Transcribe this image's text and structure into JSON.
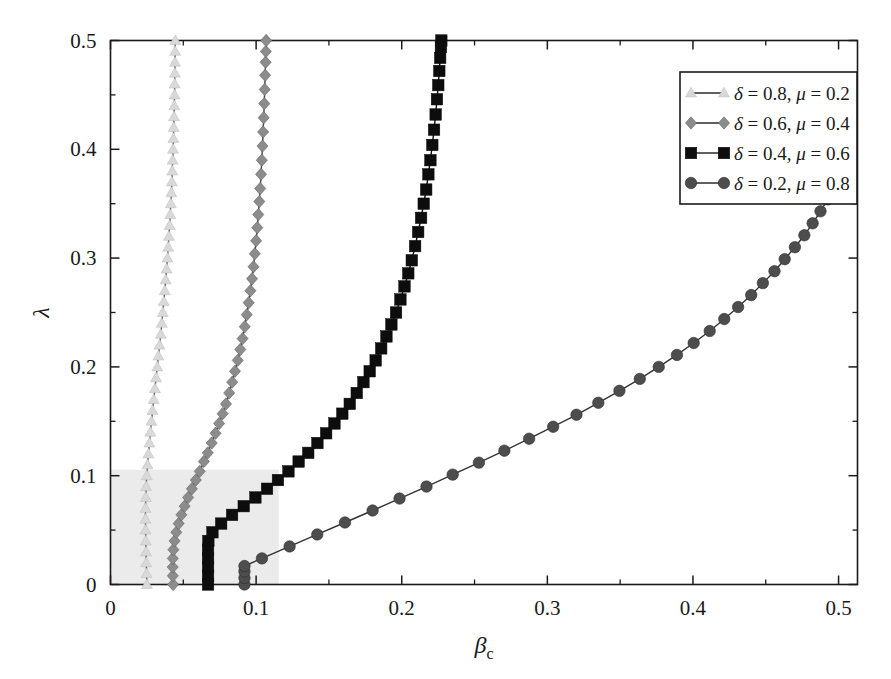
{
  "figure": {
    "title": "",
    "background_color": "#ffffff",
    "frame_color": "#1a1a1a"
  },
  "axes": {
    "x": {
      "label": "β",
      "label_sub": "c",
      "min": 0,
      "max": 0.513,
      "ticks": [
        0,
        0.1,
        0.2,
        0.3,
        0.4,
        0.5
      ],
      "tick_labels": [
        "0",
        "0.1",
        "0.2",
        "0.3",
        "0.4",
        "0.5"
      ],
      "minor_ticks": [
        0.05,
        0.15,
        0.25,
        0.35,
        0.45
      ]
    },
    "y": {
      "label": "λ",
      "min": 0,
      "max": 0.5,
      "ticks": [
        0,
        0.1,
        0.2,
        0.3,
        0.4,
        0.5
      ],
      "tick_labels": [
        "0",
        "0.1",
        "0.2",
        "0.3",
        "0.4",
        "0.5"
      ],
      "minor_ticks": [
        0.05,
        0.15,
        0.25,
        0.35,
        0.45
      ]
    }
  },
  "shaded_region": {
    "color": "#ebebeb",
    "x0": 0,
    "x1": 0.1155,
    "y0": 0,
    "y1": 0.1055
  },
  "legend": {
    "position": "top-right",
    "border_color": "#1a1a1a",
    "background": "#ffffff",
    "entries": [
      {
        "label": "δ = 0.8, μ = 0.2",
        "delta": "0.8",
        "mu": "0.2",
        "marker": "triangle",
        "color": "#d9d9d9"
      },
      {
        "label": "δ = 0.6, μ = 0.4",
        "delta": "0.6",
        "mu": "0.4",
        "marker": "diamond",
        "color": "#8c8c8c"
      },
      {
        "label": "δ = 0.4, μ = 0.6",
        "delta": "0.4",
        "mu": "0.6",
        "marker": "square",
        "color": "#0d0d0d"
      },
      {
        "label": "δ = 0.2, μ = 0.8",
        "delta": "0.2",
        "mu": "0.8",
        "marker": "circle",
        "color": "#4d4d4d"
      }
    ]
  },
  "chart_data": {
    "type": "line",
    "title": "",
    "xlabel": "β_c",
    "ylabel": "λ",
    "xlim": [
      0,
      0.513
    ],
    "ylim": [
      0,
      0.5
    ],
    "grid": false,
    "legend_position": "top-right",
    "series": [
      {
        "name": "δ = 0.8, μ = 0.2",
        "marker": "triangle",
        "color": "#d9d9d9",
        "line_color": "#555555",
        "points": [
          [
            0.025,
            0.0
          ],
          [
            0.0248,
            0.01
          ],
          [
            0.0246,
            0.02
          ],
          [
            0.0244,
            0.03
          ],
          [
            0.0242,
            0.04
          ],
          [
            0.0241,
            0.05
          ],
          [
            0.024,
            0.06
          ],
          [
            0.024,
            0.07
          ],
          [
            0.0242,
            0.08
          ],
          [
            0.0245,
            0.09
          ],
          [
            0.0249,
            0.1
          ],
          [
            0.0254,
            0.11
          ],
          [
            0.026,
            0.12
          ],
          [
            0.0267,
            0.13
          ],
          [
            0.0274,
            0.14
          ],
          [
            0.0281,
            0.15
          ],
          [
            0.0289,
            0.16
          ],
          [
            0.0297,
            0.17
          ],
          [
            0.0305,
            0.18
          ],
          [
            0.0313,
            0.19
          ],
          [
            0.0321,
            0.2
          ],
          [
            0.0329,
            0.21
          ],
          [
            0.0337,
            0.22
          ],
          [
            0.0345,
            0.23
          ],
          [
            0.0352,
            0.24
          ],
          [
            0.0359,
            0.25
          ],
          [
            0.0366,
            0.26
          ],
          [
            0.0373,
            0.27
          ],
          [
            0.0379,
            0.28
          ],
          [
            0.0385,
            0.29
          ],
          [
            0.0391,
            0.3
          ],
          [
            0.0396,
            0.31
          ],
          [
            0.0401,
            0.32
          ],
          [
            0.0406,
            0.33
          ],
          [
            0.041,
            0.34
          ],
          [
            0.0414,
            0.35
          ],
          [
            0.0418,
            0.36
          ],
          [
            0.0421,
            0.37
          ],
          [
            0.0424,
            0.38
          ],
          [
            0.0427,
            0.39
          ],
          [
            0.043,
            0.4
          ],
          [
            0.0432,
            0.41
          ],
          [
            0.0434,
            0.42
          ],
          [
            0.0436,
            0.43
          ],
          [
            0.0438,
            0.44
          ],
          [
            0.044,
            0.45
          ],
          [
            0.0441,
            0.46
          ],
          [
            0.0442,
            0.47
          ],
          [
            0.0443,
            0.48
          ],
          [
            0.0444,
            0.49
          ],
          [
            0.0445,
            0.5
          ]
        ]
      },
      {
        "name": "δ = 0.6, μ = 0.4",
        "marker": "diamond",
        "color": "#8c8c8c",
        "line_color": "#444444",
        "points": [
          [
            0.043,
            0.0
          ],
          [
            0.0428,
            0.008
          ],
          [
            0.0427,
            0.016
          ],
          [
            0.0428,
            0.024
          ],
          [
            0.0432,
            0.032
          ],
          [
            0.044,
            0.04
          ],
          [
            0.0452,
            0.048
          ],
          [
            0.0468,
            0.056
          ],
          [
            0.0487,
            0.064
          ],
          [
            0.0509,
            0.072
          ],
          [
            0.0533,
            0.08
          ],
          [
            0.0559,
            0.088
          ],
          [
            0.0586,
            0.096
          ],
          [
            0.0613,
            0.104
          ],
          [
            0.0641,
            0.113
          ],
          [
            0.0668,
            0.121
          ],
          [
            0.0695,
            0.13
          ],
          [
            0.0721,
            0.139
          ],
          [
            0.0746,
            0.148
          ],
          [
            0.077,
            0.157
          ],
          [
            0.0793,
            0.166
          ],
          [
            0.0815,
            0.176
          ],
          [
            0.0836,
            0.186
          ],
          [
            0.0855,
            0.196
          ],
          [
            0.0874,
            0.206
          ],
          [
            0.0891,
            0.216
          ],
          [
            0.0907,
            0.226
          ],
          [
            0.0922,
            0.237
          ],
          [
            0.0936,
            0.248
          ],
          [
            0.0949,
            0.259
          ],
          [
            0.0961,
            0.27
          ],
          [
            0.0972,
            0.281
          ],
          [
            0.0982,
            0.292
          ],
          [
            0.0991,
            0.304
          ],
          [
            0.1,
            0.316
          ],
          [
            0.1008,
            0.328
          ],
          [
            0.1015,
            0.34
          ],
          [
            0.1022,
            0.352
          ],
          [
            0.1028,
            0.364
          ],
          [
            0.1034,
            0.377
          ],
          [
            0.1039,
            0.39
          ],
          [
            0.1044,
            0.403
          ],
          [
            0.1048,
            0.416
          ],
          [
            0.1052,
            0.429
          ],
          [
            0.1056,
            0.442
          ],
          [
            0.1059,
            0.455
          ],
          [
            0.1062,
            0.468
          ],
          [
            0.1065,
            0.48
          ],
          [
            0.1067,
            0.49
          ],
          [
            0.1069,
            0.5
          ]
        ]
      },
      {
        "name": "δ = 0.4, μ = 0.6",
        "marker": "square",
        "color": "#0d0d0d",
        "line_color": "#0d0d0d",
        "points": [
          [
            0.067,
            0.0
          ],
          [
            0.067,
            0.008
          ],
          [
            0.067,
            0.016
          ],
          [
            0.067,
            0.024
          ],
          [
            0.067,
            0.032
          ],
          [
            0.0672,
            0.04
          ],
          [
            0.07,
            0.048
          ],
          [
            0.076,
            0.056
          ],
          [
            0.0835,
            0.064
          ],
          [
            0.0915,
            0.072
          ],
          [
            0.0995,
            0.08
          ],
          [
            0.1075,
            0.088
          ],
          [
            0.115,
            0.096
          ],
          [
            0.1222,
            0.104
          ],
          [
            0.1292,
            0.113
          ],
          [
            0.1358,
            0.121
          ],
          [
            0.1421,
            0.13
          ],
          [
            0.1481,
            0.139
          ],
          [
            0.1538,
            0.148
          ],
          [
            0.1592,
            0.157
          ],
          [
            0.1643,
            0.166
          ],
          [
            0.1691,
            0.176
          ],
          [
            0.1737,
            0.186
          ],
          [
            0.178,
            0.196
          ],
          [
            0.1821,
            0.206
          ],
          [
            0.1859,
            0.217
          ],
          [
            0.1895,
            0.228
          ],
          [
            0.1929,
            0.239
          ],
          [
            0.1961,
            0.25
          ],
          [
            0.1991,
            0.262
          ],
          [
            0.2019,
            0.274
          ],
          [
            0.2045,
            0.286
          ],
          [
            0.2069,
            0.298
          ],
          [
            0.2092,
            0.311
          ],
          [
            0.2113,
            0.324
          ],
          [
            0.2133,
            0.337
          ],
          [
            0.2151,
            0.35
          ],
          [
            0.2168,
            0.363
          ],
          [
            0.2183,
            0.377
          ],
          [
            0.2197,
            0.39
          ],
          [
            0.221,
            0.404
          ],
          [
            0.2222,
            0.418
          ],
          [
            0.2233,
            0.432
          ],
          [
            0.2242,
            0.446
          ],
          [
            0.2251,
            0.459
          ],
          [
            0.2258,
            0.472
          ],
          [
            0.2264,
            0.484
          ],
          [
            0.2269,
            0.494
          ],
          [
            0.2272,
            0.5
          ]
        ]
      },
      {
        "name": "δ = 0.2, μ = 0.8",
        "marker": "circle",
        "color": "#4d4d4d",
        "line_color": "#333333",
        "points": [
          [
            0.092,
            0.0
          ],
          [
            0.092,
            0.006
          ],
          [
            0.092,
            0.012
          ],
          [
            0.092,
            0.017
          ],
          [
            0.104,
            0.024
          ],
          [
            0.123,
            0.035
          ],
          [
            0.142,
            0.046
          ],
          [
            0.161,
            0.057
          ],
          [
            0.18,
            0.068
          ],
          [
            0.1985,
            0.079
          ],
          [
            0.217,
            0.09
          ],
          [
            0.235,
            0.101
          ],
          [
            0.253,
            0.112
          ],
          [
            0.2705,
            0.123
          ],
          [
            0.2875,
            0.134
          ],
          [
            0.304,
            0.145
          ],
          [
            0.32,
            0.156
          ],
          [
            0.335,
            0.167
          ],
          [
            0.3495,
            0.178
          ],
          [
            0.3635,
            0.189
          ],
          [
            0.3765,
            0.2
          ],
          [
            0.389,
            0.211
          ],
          [
            0.4005,
            0.222
          ],
          [
            0.4115,
            0.233
          ],
          [
            0.4215,
            0.244
          ],
          [
            0.431,
            0.255
          ],
          [
            0.44,
            0.266
          ],
          [
            0.448,
            0.277
          ],
          [
            0.456,
            0.288
          ],
          [
            0.463,
            0.299
          ],
          [
            0.47,
            0.31
          ],
          [
            0.4765,
            0.321
          ],
          [
            0.4822,
            0.332
          ],
          [
            0.4876,
            0.343
          ],
          [
            0.4925,
            0.354
          ],
          [
            0.4968,
            0.365
          ],
          [
            0.5005,
            0.376
          ],
          [
            0.5035,
            0.387
          ],
          [
            0.5055,
            0.396
          ],
          [
            0.5065,
            0.402
          ]
        ]
      }
    ]
  }
}
